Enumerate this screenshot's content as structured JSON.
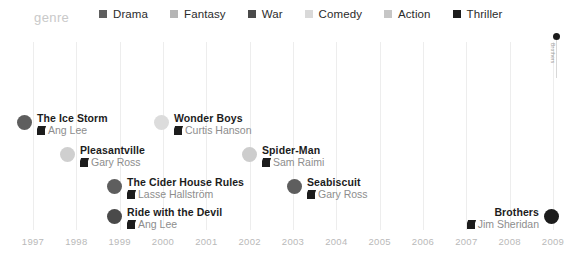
{
  "legend": {
    "title": "genre",
    "items": [
      {
        "label": "Drama",
        "color": "#5e5e5e"
      },
      {
        "label": "Fantasy",
        "color": "#b5b5b5"
      },
      {
        "label": "War",
        "color": "#4a4a4a"
      },
      {
        "label": "Comedy",
        "color": "#d9d9d9"
      },
      {
        "label": "Action",
        "color": "#c6c6c6"
      },
      {
        "label": "Thriller",
        "color": "#1c1c1c"
      }
    ]
  },
  "axis": {
    "ticks": [
      "1997",
      "1998",
      "1999",
      "2000",
      "2001",
      "2002",
      "2003",
      "2004",
      "2005",
      "2006",
      "2007",
      "2008",
      "2009"
    ]
  },
  "annotation": {
    "label": "Brothers",
    "icon": "thriller-marker"
  },
  "chart_data": {
    "type": "scatter",
    "title": "genre",
    "xlabel": "",
    "ylabel": "",
    "xlim": [
      1997,
      2009
    ],
    "grid": true,
    "legend_position": "top",
    "categories": [
      "Drama",
      "Fantasy",
      "War",
      "Comedy",
      "Action",
      "Thriller"
    ],
    "points": [
      {
        "title": "The Ice Storm",
        "director": "Ang Lee",
        "year": 1997,
        "genre": "Drama",
        "color": "#5e5e5e",
        "side": "right",
        "x": 25,
        "y": 112
      },
      {
        "title": "Pleasantville",
        "director": "Gary Ross",
        "year": 1998,
        "genre": "Comedy",
        "color": "#cfcfcf",
        "side": "right",
        "x": 68,
        "y": 144
      },
      {
        "title": "The Cider House Rules",
        "director": "Lasse Hallström",
        "year": 1999,
        "genre": "Drama",
        "color": "#5e5e5e",
        "side": "right",
        "x": 115,
        "y": 176
      },
      {
        "title": "Ride with the Devil",
        "director": "Ang Lee",
        "year": 1999,
        "genre": "War",
        "color": "#4a4a4a",
        "side": "right",
        "x": 115,
        "y": 206
      },
      {
        "title": "Wonder Boys",
        "director": "Curtis Hanson",
        "year": 2000,
        "genre": "Comedy",
        "color": "#dcdcdc",
        "side": "right",
        "x": 162,
        "y": 112
      },
      {
        "title": "Spider-Man",
        "director": "Sam Raimi",
        "year": 2002,
        "genre": "Action",
        "color": "#cdcdcd",
        "side": "right",
        "x": 250,
        "y": 144
      },
      {
        "title": "Seabiscuit",
        "director": "Gary Ross",
        "year": 2003,
        "genre": "Drama",
        "color": "#5e5e5e",
        "side": "right",
        "x": 295,
        "y": 176
      },
      {
        "title": "Brothers",
        "director": "Jim Sheridan",
        "year": 2009,
        "genre": "Thriller",
        "color": "#1c1c1c",
        "side": "left",
        "x": 551,
        "y": 206
      }
    ]
  }
}
